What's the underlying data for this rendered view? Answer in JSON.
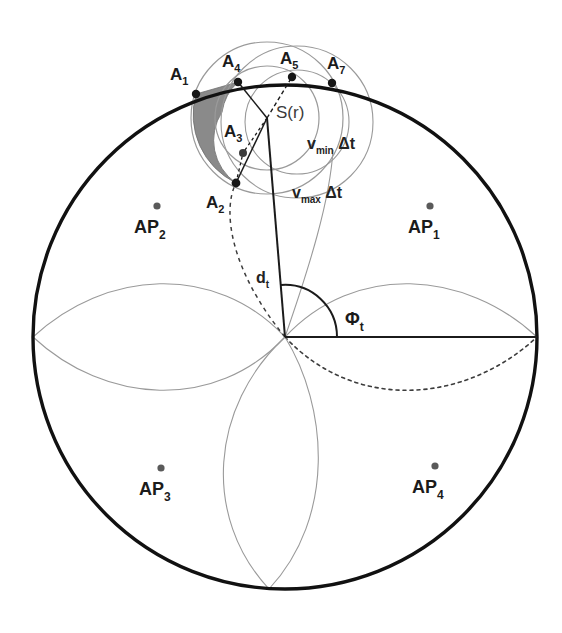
{
  "figure": {
    "background_color": "#ffffff",
    "ink_color": "#1b1b1b"
  },
  "colors": {
    "outer_circle": "#111111",
    "thin_curve": "#8d8d8d",
    "dashed_curve": "#3c3c3c",
    "shaded_region": "#8a8a8a",
    "point_fill": "#161616",
    "ap_point_fill": "#5a5a5a",
    "label_text": "#1b1b1b",
    "source_label": "#3a3a3a"
  },
  "geometry": {
    "outer_circle": {
      "cx": 285,
      "cy": 337,
      "r": 252,
      "stroke_width": 3.4
    },
    "source": {
      "cx": 267,
      "cy": 118,
      "label": "S(r)"
    },
    "v_min_circle": {
      "cx": 267,
      "cy": 118,
      "r": 52
    },
    "v_max_circle": {
      "cx": 267,
      "cy": 118,
      "r": 76
    },
    "origin": {
      "x": 285,
      "y": 337
    },
    "rose_petal_count": 4,
    "angle_arc_radius": 52
  },
  "boundary_points": [
    {
      "id": "A1",
      "label": "A",
      "sub": "1",
      "x": 196,
      "y": 94,
      "label_x": 170,
      "label_y": 80
    },
    {
      "id": "A4",
      "label": "A",
      "sub": "4",
      "x": 238,
      "y": 82,
      "label_x": 222,
      "label_y": 67
    },
    {
      "id": "A5",
      "label": "A",
      "sub": "5",
      "x": 292,
      "y": 77,
      "label_x": 280,
      "label_y": 64
    },
    {
      "id": "A7",
      "label": "A",
      "sub": "7",
      "x": 332,
      "y": 83,
      "label_x": 327,
      "label_y": 69
    },
    {
      "id": "A3",
      "label": "A",
      "sub": "3",
      "x": 243,
      "y": 153,
      "label_x": 224,
      "label_y": 133
    },
    {
      "id": "A2",
      "label": "A",
      "sub": "2",
      "x": 236,
      "y": 183,
      "label_x": 210,
      "label_y": 205
    }
  ],
  "access_points": [
    {
      "id": "AP1",
      "label": "AP",
      "sub": "1",
      "dot_x": 430,
      "dot_y": 206,
      "label_x": 408,
      "label_y": 233
    },
    {
      "id": "AP2",
      "label": "AP",
      "sub": "2",
      "dot_x": 157,
      "dot_y": 206,
      "label_x": 134,
      "label_y": 233
    },
    {
      "id": "AP3",
      "label": "AP",
      "sub": "3",
      "dot_x": 161,
      "dot_y": 468,
      "label_x": 139,
      "label_y": 495
    },
    {
      "id": "AP4",
      "label": "AP",
      "sub": "4",
      "dot_x": 435,
      "dot_y": 466,
      "label_x": 412,
      "label_y": 493
    }
  ],
  "annotations": {
    "source_label": "S(r)",
    "v_min": {
      "base": "v",
      "sub": "min",
      "suffix": " Δt",
      "x": 307,
      "y": 149
    },
    "v_max": {
      "base": "v",
      "sub": "max",
      "suffix": " Δt",
      "x": 292,
      "y": 198
    },
    "distance": {
      "base": "d",
      "sub": "t",
      "x": 260,
      "y": 283
    },
    "angle": {
      "base": "Φ",
      "sub": "t",
      "x": 348,
      "y": 325
    }
  },
  "legend_description": {
    "solid_thick": "Outer coverage circle boundary",
    "thin_gray": "Four-petal rose lobes and velocity rings",
    "dashed": "Dashed rose lobe and A2 bearing line",
    "shaded": "Feasible source region (annulus sector)"
  }
}
